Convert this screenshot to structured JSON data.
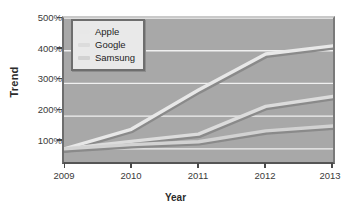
{
  "chart_data": {
    "type": "line",
    "title": "",
    "xlabel": "Year",
    "ylabel": "Trend",
    "x": [
      2009,
      2010,
      2011,
      2012,
      2013
    ],
    "xtick_labels": [
      "2009",
      "2010",
      "2011",
      "2012",
      "2013"
    ],
    "ytick_labels": [
      "100%",
      "200%",
      "300%",
      "400%",
      "500%"
    ],
    "ytick_values": [
      100,
      200,
      300,
      400,
      500
    ],
    "ylim": [
      60,
      500
    ],
    "xlim": [
      2009,
      2013
    ],
    "grid": true,
    "grid_color": "#f0f0f0",
    "plot_background": "#a8a8a8",
    "legend_position": "upper-left-inside",
    "series": [
      {
        "name": "Apple",
        "color": "#e8e8e8",
        "values": [
          100,
          160,
          280,
          390,
          415
        ]
      },
      {
        "name": "Google",
        "color": "#dcdcdc",
        "values": [
          100,
          123,
          145,
          230,
          260
        ]
      },
      {
        "name": "Samsung",
        "color": "#d2d2d2",
        "values": [
          100,
          113,
          122,
          155,
          170
        ]
      }
    ]
  },
  "legend": {
    "entries": [
      {
        "label": "Apple"
      },
      {
        "label": "Google"
      },
      {
        "label": "Samsung"
      }
    ]
  },
  "axes": {
    "y_title": "Trend",
    "x_title": "Year"
  }
}
